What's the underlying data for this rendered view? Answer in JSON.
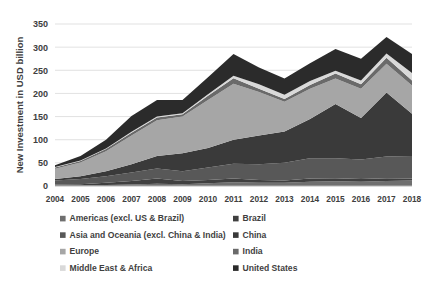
{
  "chart_data": {
    "type": "area",
    "stacked": true,
    "title": "",
    "xlabel": "",
    "ylabel": "New Investment in USD billion",
    "ylim": [
      0,
      350
    ],
    "ytick_step": 50,
    "yticks": [
      0,
      50,
      100,
      150,
      200,
      250,
      300,
      350
    ],
    "grid": true,
    "legend_position": "bottom",
    "legend_columns": 2,
    "categories": [
      "2004",
      "2005",
      "2006",
      "2007",
      "2008",
      "2009",
      "2010",
      "2011",
      "2012",
      "2013",
      "2014",
      "2015",
      "2016",
      "2017",
      "2018"
    ],
    "series": [
      {
        "name": "Americas (excl. US & Brazil)",
        "color": "#6f6f6f",
        "values": [
          1,
          1,
          2,
          3,
          5,
          4,
          6,
          8,
          7,
          7,
          9,
          10,
          9,
          11,
          12
        ]
      },
      {
        "name": "Brazil",
        "color": "#404040",
        "values": [
          2,
          3,
          5,
          8,
          11,
          7,
          7,
          8,
          6,
          5,
          7,
          7,
          6,
          6,
          4
        ]
      },
      {
        "name": "Asia and Oceania (excl. China & India)",
        "color": "#585858",
        "values": [
          9,
          11,
          14,
          18,
          22,
          21,
          27,
          32,
          34,
          38,
          44,
          43,
          42,
          47,
          49
        ]
      },
      {
        "name": "China",
        "color": "#3a3a3a",
        "values": [
          3,
          6,
          11,
          18,
          27,
          39,
          42,
          52,
          62,
          68,
          85,
          117,
          90,
          138,
          91
        ]
      },
      {
        "name": "Europe",
        "color": "#a6a6a6",
        "values": [
          22,
          30,
          43,
          62,
          77,
          79,
          104,
          121,
          94,
          64,
          65,
          55,
          63,
          62,
          61
        ]
      },
      {
        "name": "India",
        "color": "#6a6a6a",
        "values": [
          3,
          3,
          5,
          6,
          6,
          5,
          9,
          12,
          7,
          6,
          8,
          11,
          10,
          13,
          11
        ]
      },
      {
        "name": "Middle East & Africa",
        "color": "#d9d9d9",
        "values": [
          1,
          1,
          1,
          2,
          2,
          2,
          3,
          5,
          10,
          9,
          9,
          6,
          8,
          9,
          16
        ]
      },
      {
        "name": "United States",
        "color": "#2b2b2b",
        "values": [
          4,
          10,
          19,
          34,
          36,
          29,
          37,
          47,
          36,
          35,
          38,
          47,
          47,
          36,
          41
        ]
      }
    ],
    "totals": [
      45,
      65,
      100,
      151,
      186,
      186,
      235,
      285,
      256,
      232,
      265,
      296,
      275,
      322,
      285
    ]
  },
  "legend": {
    "entries": [
      {
        "label": "Americas (excl. US & Brazil)",
        "color": "#6f6f6f"
      },
      {
        "label": "Brazil",
        "color": "#404040"
      },
      {
        "label": "Asia and Oceania (excl. China & India)",
        "color": "#585858"
      },
      {
        "label": "China",
        "color": "#3a3a3a"
      },
      {
        "label": "Europe",
        "color": "#a6a6a6"
      },
      {
        "label": "India",
        "color": "#6a6a6a"
      },
      {
        "label": "Middle East & Africa",
        "color": "#d9d9d9"
      },
      {
        "label": "United States",
        "color": "#2b2b2b"
      }
    ]
  }
}
